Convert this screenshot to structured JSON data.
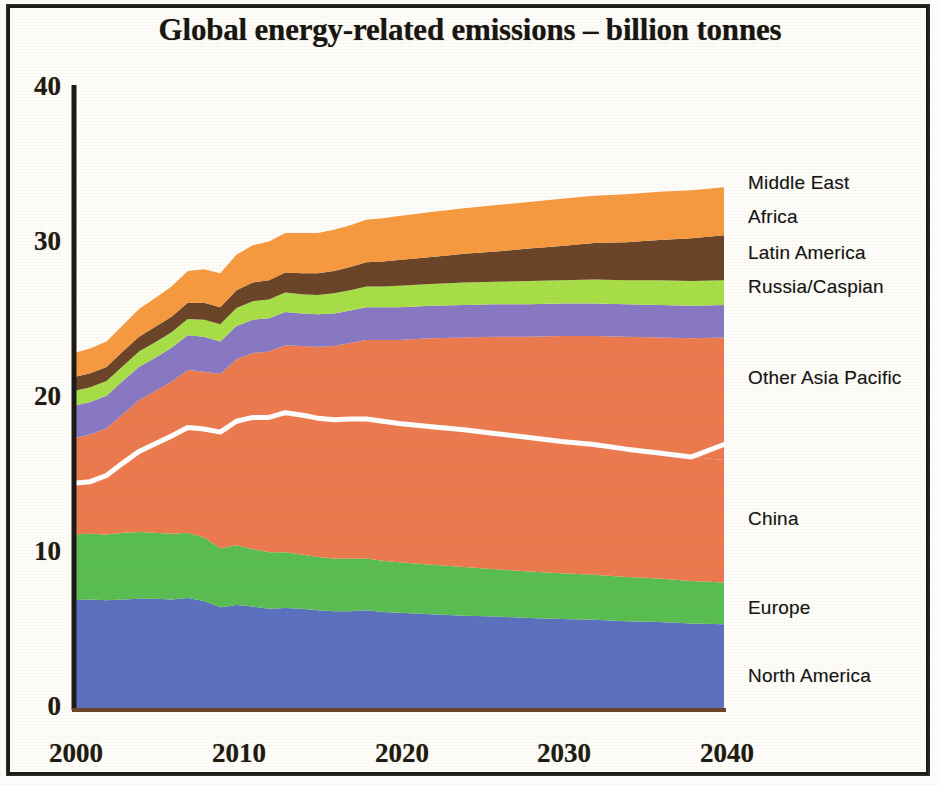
{
  "chart_data": {
    "type": "area",
    "stacked": true,
    "title": "Global energy-related emissions – billion tonnes",
    "xlabel": "",
    "ylabel": "",
    "unit": "billion tonnes",
    "xlim": [
      2000,
      2040
    ],
    "ylim": [
      0,
      40
    ],
    "xticks": [
      "2000",
      "2010",
      "2020",
      "2030",
      "2040"
    ],
    "yticks": [
      "0",
      "10",
      "20",
      "30",
      "40"
    ],
    "grid": false,
    "legend_position": "right-inline-labels",
    "x": [
      2000,
      2001,
      2002,
      2003,
      2004,
      2005,
      2006,
      2007,
      2008,
      2009,
      2010,
      2011,
      2012,
      2013,
      2014,
      2015,
      2016,
      2017,
      2018,
      2019,
      2020,
      2022,
      2024,
      2026,
      2028,
      2030,
      2032,
      2034,
      2036,
      2038,
      2040
    ],
    "series": [
      {
        "name": "North America",
        "color": "#5b70be",
        "values": [
          6.95,
          7.0,
          6.95,
          7.0,
          7.05,
          7.05,
          7.0,
          7.1,
          6.9,
          6.5,
          6.65,
          6.55,
          6.4,
          6.45,
          6.4,
          6.3,
          6.25,
          6.25,
          6.3,
          6.2,
          6.15,
          6.05,
          5.95,
          5.9,
          5.8,
          5.75,
          5.7,
          5.6,
          5.55,
          5.45,
          5.4
        ]
      },
      {
        "name": "Europe",
        "color": "#59bd52",
        "values": [
          4.25,
          4.25,
          4.25,
          4.3,
          4.3,
          4.25,
          4.25,
          4.2,
          4.1,
          3.8,
          3.85,
          3.7,
          3.65,
          3.6,
          3.5,
          3.45,
          3.4,
          3.4,
          3.35,
          3.3,
          3.25,
          3.2,
          3.15,
          3.05,
          3.0,
          2.95,
          2.9,
          2.85,
          2.8,
          2.75,
          2.7
        ]
      },
      {
        "name": "China",
        "color": "#ec7a4e",
        "values": [
          3.3,
          3.45,
          3.8,
          4.5,
          5.2,
          5.75,
          6.3,
          6.8,
          7.0,
          7.5,
          8.0,
          8.5,
          8.7,
          9.0,
          9.0,
          8.95,
          8.95,
          9.0,
          9.0,
          9.0,
          8.95,
          8.9,
          8.85,
          8.75,
          8.65,
          8.5,
          8.4,
          8.25,
          8.1,
          8.0,
          7.9
        ]
      },
      {
        "name": "Other Asia Pacific",
        "color": "#ec7a4e",
        "values": [
          2.9,
          2.95,
          3.05,
          3.15,
          3.3,
          3.4,
          3.5,
          3.7,
          3.7,
          3.75,
          4.0,
          4.15,
          4.25,
          4.35,
          4.45,
          4.6,
          4.75,
          4.9,
          5.1,
          5.25,
          5.4,
          5.7,
          5.95,
          6.25,
          6.5,
          6.8,
          7.0,
          7.25,
          7.45,
          7.65,
          7.9
        ]
      },
      {
        "name": "Russia/Caspian",
        "color": "#8878c3",
        "values": [
          2.1,
          2.1,
          2.1,
          2.15,
          2.15,
          2.15,
          2.2,
          2.25,
          2.25,
          2.1,
          2.15,
          2.15,
          2.15,
          2.15,
          2.1,
          2.1,
          2.1,
          2.1,
          2.1,
          2.1,
          2.1,
          2.1,
          2.1,
          2.1,
          2.1,
          2.1,
          2.1,
          2.1,
          2.1,
          2.1,
          2.1
        ]
      },
      {
        "name": "Latin America",
        "color": "#a8de47",
        "values": [
          0.95,
          0.95,
          0.95,
          0.95,
          1.0,
          1.0,
          1.0,
          1.05,
          1.1,
          1.1,
          1.15,
          1.2,
          1.2,
          1.25,
          1.25,
          1.25,
          1.3,
          1.3,
          1.35,
          1.35,
          1.4,
          1.4,
          1.45,
          1.45,
          1.5,
          1.5,
          1.55,
          1.55,
          1.6,
          1.6,
          1.6
        ]
      },
      {
        "name": "Africa",
        "color": "#6b4428",
        "values": [
          0.9,
          0.9,
          0.9,
          0.95,
          0.95,
          1.0,
          1.0,
          1.05,
          1.1,
          1.1,
          1.15,
          1.2,
          1.25,
          1.3,
          1.35,
          1.4,
          1.45,
          1.5,
          1.55,
          1.6,
          1.65,
          1.75,
          1.85,
          1.95,
          2.1,
          2.2,
          2.35,
          2.45,
          2.6,
          2.75,
          2.9
        ]
      },
      {
        "name": "Middle East",
        "color": "#f7993f",
        "values": [
          1.55,
          1.6,
          1.65,
          1.7,
          1.8,
          1.85,
          1.95,
          2.05,
          2.15,
          2.2,
          2.3,
          2.4,
          2.5,
          2.55,
          2.6,
          2.6,
          2.65,
          2.7,
          2.75,
          2.8,
          2.85,
          2.9,
          2.95,
          3.0,
          3.0,
          3.05,
          3.05,
          3.1,
          3.1,
          3.1,
          3.1
        ]
      }
    ],
    "annotations": [
      {
        "type": "divider-line",
        "label": "China / Other Asia Pacific boundary",
        "color": "#ffffff",
        "values": [
          14.5,
          14.6,
          15.0,
          15.8,
          16.55,
          17.05,
          17.55,
          18.1,
          18.0,
          17.8,
          18.5,
          18.75,
          18.75,
          19.05,
          18.9,
          18.7,
          18.6,
          18.65,
          18.65,
          18.5,
          18.35,
          18.15,
          17.95,
          17.7,
          17.45,
          17.2,
          17.0,
          16.7,
          16.45,
          16.2,
          17.0
        ]
      }
    ],
    "totals": [
      23.9,
      24.2,
      24.7,
      26.7,
      28.75,
      28.45,
      29.2,
      30.15,
      28.3,
      28.05,
      29.25,
      29.85,
      30.1,
      30.65,
      30.65,
      30.65,
      30.85,
      31.15,
      31.5,
      31.6,
      31.75,
      32.0,
      32.15,
      32.45,
      32.65,
      32.85,
      33.05,
      33.15,
      33.3,
      33.4,
      33.6
    ]
  },
  "chart": {
    "title": "Global energy-related emissions – billion tonnes",
    "y_ticks": [
      "40",
      "30",
      "20",
      "10",
      "0"
    ],
    "x_ticks": [
      "2000",
      "2010",
      "2020",
      "2030",
      "2040"
    ],
    "series_labels": [
      "Middle East",
      "Africa",
      "Latin America",
      "Russia/Caspian",
      "Other Asia Pacific",
      "China",
      "Europe",
      "North America"
    ],
    "colors": {
      "north_america": "#5b70be",
      "europe": "#59bd52",
      "china": "#ec7a4e",
      "other_asia_pacific": "#ec7a4e",
      "russia_caspian": "#8878c3",
      "latin_america": "#a8de47",
      "africa": "#6b4428",
      "middle_east": "#f7993f",
      "axis": "#1c1a18",
      "divider": "#ffffff"
    }
  }
}
